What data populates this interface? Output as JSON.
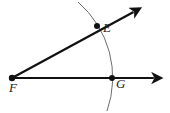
{
  "figure": {
    "width": 170,
    "height": 113,
    "background_color": "#ffffff",
    "stroke_color": "#111111",
    "arc_color": "#5a5a5a",
    "labels": {
      "vertex": "F",
      "point_on_upper_ray": "E",
      "point_on_lower_ray": "G"
    },
    "points": {
      "F": {
        "x": 12,
        "y": 78
      },
      "E": {
        "x": 97,
        "y": 26
      },
      "G": {
        "x": 112,
        "y": 78
      }
    },
    "rays": [
      {
        "name": "ray-FE",
        "from": {
          "x": 12,
          "y": 78
        },
        "to": {
          "x": 139,
          "y": 9
        },
        "arrowhead": true,
        "stroke_width": 2.2
      },
      {
        "name": "ray-FG",
        "from": {
          "x": 12,
          "y": 78
        },
        "to": {
          "x": 160,
          "y": 78
        },
        "arrowhead": true,
        "stroke_width": 2.2
      }
    ],
    "arc": {
      "name": "compass-arc",
      "center": {
        "x": 12,
        "y": 78
      },
      "radius": 100,
      "start": {
        "x": 78,
        "y": 2
      },
      "end": {
        "x": 107,
        "y": 111
      },
      "stroke_width": 0.9
    },
    "dots": [
      {
        "name": "vertex-dot-F",
        "x": 12,
        "y": 78,
        "r": 3.2
      },
      {
        "name": "point-dot-E",
        "x": 97,
        "y": 26,
        "r": 3.0
      },
      {
        "name": "point-dot-G",
        "x": 112,
        "y": 78,
        "r": 3.0
      }
    ]
  }
}
